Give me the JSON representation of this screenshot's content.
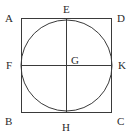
{
  "figure": {
    "name": "square-with-inscribed-circle",
    "background_color": "#ffffff",
    "stroke_color": "#3a3a3a",
    "label_color": "#2b2b2b",
    "stroke_width": 1,
    "square": {
      "left": 21,
      "top": 18,
      "right": 112,
      "bottom": 113
    },
    "circle": {
      "cx": 66.5,
      "cy": 65.5,
      "r": 45.5
    },
    "diameters": {
      "vertical": {
        "x": 66.5,
        "y1": 18,
        "y2": 113
      },
      "horizontal": {
        "y": 65.5,
        "x1": 21,
        "x2": 112
      }
    },
    "labels": [
      {
        "id": "A",
        "text": "A",
        "role": "square-corner-top-left",
        "x": 5,
        "y": 13
      },
      {
        "id": "E",
        "text": "E",
        "role": "circle-top-tangent-point",
        "x": 63,
        "y": 4
      },
      {
        "id": "D",
        "text": "D",
        "role": "square-corner-top-right",
        "x": 117,
        "y": 13
      },
      {
        "id": "F",
        "text": "F",
        "role": "circle-left-tangent-point",
        "x": 6,
        "y": 60
      },
      {
        "id": "G",
        "text": "G",
        "role": "circle-center",
        "x": 71,
        "y": 55
      },
      {
        "id": "K",
        "text": "K",
        "role": "circle-right-tangent-point",
        "x": 118,
        "y": 60
      },
      {
        "id": "B",
        "text": "B",
        "role": "square-corner-bottom-left",
        "x": 5,
        "y": 116
      },
      {
        "id": "H",
        "text": "H",
        "role": "circle-bottom-tangent-point",
        "x": 62,
        "y": 122
      },
      {
        "id": "C",
        "text": "C",
        "role": "square-corner-bottom-right",
        "x": 117,
        "y": 116
      }
    ]
  }
}
